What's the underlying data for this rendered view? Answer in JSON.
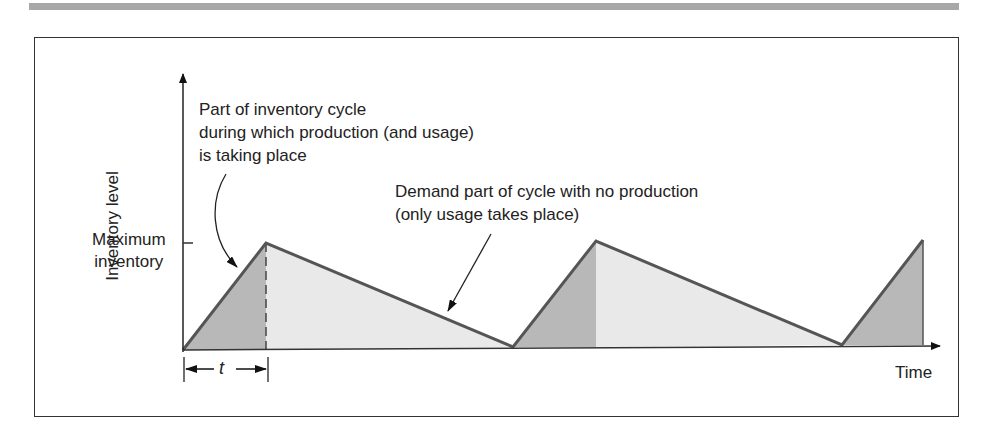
{
  "diagram": {
    "y_axis_label": "Inventory level",
    "x_axis_label": "Time",
    "max_inventory_label": [
      "Maximum",
      "inventory"
    ],
    "production_annotation": [
      "Part of inventory cycle",
      "during which production (and usage)",
      "is taking place"
    ],
    "demand_annotation": [
      "Demand part of cycle with no production",
      "(only usage takes place)"
    ],
    "time_interval_label": "t",
    "colors": {
      "production_fill": "#b8b8b8",
      "demand_fill": "#e9e9e9",
      "line": "#555555",
      "frame": "#333333",
      "top_bar": "#a8a8a8"
    },
    "cycles": [
      {
        "start_x": 183,
        "peak_x": 266,
        "end_x": 513
      },
      {
        "start_x": 513,
        "peak_x": 596,
        "end_x": 842
      },
      {
        "start_x": 842,
        "peak_x": 923,
        "end_x": null
      }
    ]
  }
}
